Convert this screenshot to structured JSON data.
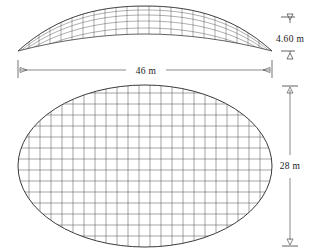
{
  "drawing": {
    "title": "Elliptical gridshell dome — elevation and plan",
    "line_color": "#4a4a4a",
    "outline_color": "#555555",
    "text_color": "#1a1a1a",
    "background": "#ffffff"
  },
  "dimensions": {
    "height": {
      "label": "4.60 m",
      "value": 4.6,
      "unit": "m",
      "orientation": "vertical"
    },
    "span": {
      "label": "46 m",
      "value": 46,
      "unit": "m",
      "orientation": "horizontal"
    },
    "depth": {
      "label": "28 m",
      "value": 28,
      "unit": "m",
      "orientation": "vertical"
    }
  },
  "views": {
    "elevation": {
      "name": "elevation",
      "rise": 4.6,
      "span": 46,
      "rib_count": 23,
      "ring_count": 4
    },
    "plan": {
      "name": "plan",
      "major_axis": 46,
      "minor_axis": 28,
      "grid_columns": 23,
      "grid_rows": 14
    }
  },
  "markers": {
    "level_top": "level-arrow-down",
    "level_bottom": "level-arrow-up",
    "span_left": "dimension-arrow-left",
    "span_right": "dimension-arrow-right",
    "depth_top": "dimension-arrow-up",
    "depth_bottom": "dimension-arrow-down"
  }
}
